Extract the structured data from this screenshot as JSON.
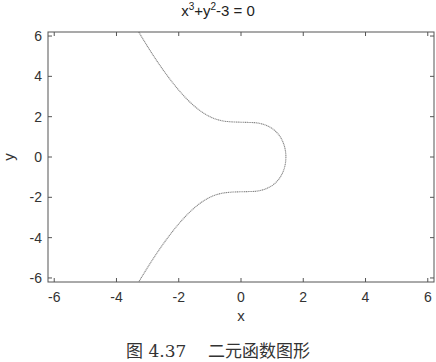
{
  "chart_data": {
    "type": "line",
    "title_parts": {
      "base1": "x",
      "exp1": "3",
      "mid": "+y",
      "exp2": "2",
      "tail": "-3 = 0"
    },
    "xlabel": "x",
    "ylabel": "y",
    "xlim": [
      -6.2,
      6.2
    ],
    "ylim": [
      -6.2,
      6.2
    ],
    "xticks": [
      -6,
      -4,
      -2,
      0,
      2,
      4,
      6
    ],
    "yticks": [
      -6,
      -4,
      -2,
      0,
      2,
      4,
      6
    ],
    "grid": false,
    "legend": null,
    "series": [
      {
        "name": "x^3+y^2-3=0",
        "color": "#888888",
        "style": "dotted-thin",
        "points": [
          {
            "x": -3.285,
            "y": 6.2
          },
          {
            "x": -3.208,
            "y": 6
          },
          {
            "x": -2.802,
            "y": 5
          },
          {
            "x": -2.351,
            "y": 4
          },
          {
            "x": -1.817,
            "y": 3
          },
          {
            "x": -1.0,
            "y": 2
          },
          {
            "x": 0.0,
            "y": 1.732
          },
          {
            "x": 1.26,
            "y": 1
          },
          {
            "x": 1.442,
            "y": 0
          },
          {
            "x": 1.26,
            "y": -1
          },
          {
            "x": 0.0,
            "y": -1.732
          },
          {
            "x": -1.0,
            "y": -2
          },
          {
            "x": -1.817,
            "y": -3
          },
          {
            "x": -2.351,
            "y": -4
          },
          {
            "x": -2.802,
            "y": -5
          },
          {
            "x": -3.208,
            "y": -6
          },
          {
            "x": -3.285,
            "y": -6.2
          }
        ]
      }
    ]
  },
  "caption": "图 4.37    二元函数图形"
}
